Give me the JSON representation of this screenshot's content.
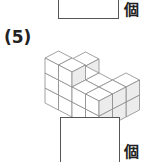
{
  "previous_answer": {
    "unit_label": "個",
    "value": ""
  },
  "problem": {
    "number_label": "(5)",
    "figure": {
      "description": "stacked unit cubes",
      "colors": {
        "line": "#8a8a8a",
        "top": "#ffffff",
        "left": "#ffffff",
        "right": "#ececec"
      },
      "cubes": [
        [
          0,
          0,
          0
        ],
        [
          1,
          0,
          0
        ],
        [
          2,
          0,
          0
        ],
        [
          3,
          0,
          0
        ],
        [
          0,
          1,
          0
        ],
        [
          1,
          1,
          0
        ],
        [
          2,
          1,
          0
        ],
        [
          3,
          1,
          0
        ],
        [
          0,
          2,
          0
        ],
        [
          1,
          2,
          0
        ],
        [
          3,
          2,
          0
        ],
        [
          0,
          0,
          1
        ],
        [
          1,
          0,
          1
        ],
        [
          2,
          0,
          1
        ],
        [
          3,
          0,
          1
        ],
        [
          0,
          1,
          1
        ],
        [
          1,
          1,
          1
        ],
        [
          2,
          1,
          1
        ],
        [
          3,
          1,
          1
        ],
        [
          0,
          2,
          1
        ],
        [
          3,
          2,
          1
        ],
        [
          0,
          0,
          2
        ],
        [
          1,
          0,
          2
        ]
      ]
    },
    "answer": {
      "unit_label": "個",
      "value": ""
    }
  }
}
